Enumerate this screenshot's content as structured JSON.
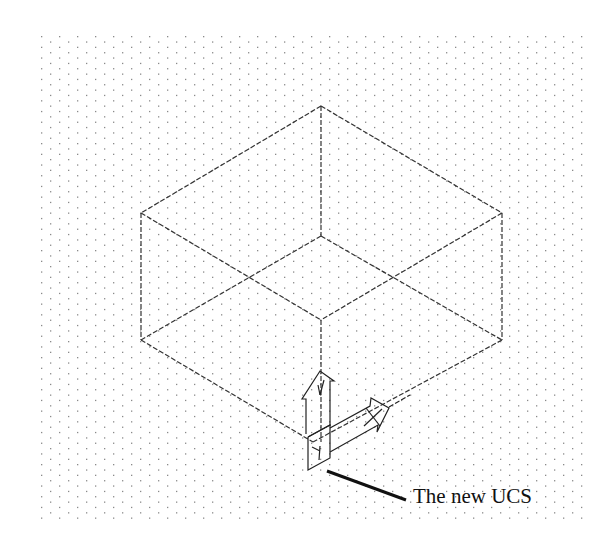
{
  "figure": {
    "annotation": "The new UCS"
  },
  "colors": {
    "background": "#ffffff",
    "grid_dot": "#8a8a8a",
    "line": "#333333",
    "leader": "#111111"
  },
  "grid": {
    "x0": 41,
    "y0": 36,
    "x1": 586,
    "y1": 518,
    "dx": 18,
    "dy": 5.35
  },
  "box": {
    "vertices": {
      "top": [
        321,
        106
      ],
      "left_top": [
        141,
        213
      ],
      "right_top": [
        502,
        213
      ],
      "center_top": [
        321,
        236
      ],
      "left_bottom": [
        141,
        340
      ],
      "right_bottom": [
        502,
        340
      ],
      "center_mid": [
        321,
        320
      ],
      "bottom": [
        313,
        442
      ]
    }
  },
  "ucs_icon": {
    "origin": [
      313,
      442
    ]
  },
  "leader": {
    "from": [
      327,
      471
    ],
    "to": [
      406,
      500
    ]
  }
}
